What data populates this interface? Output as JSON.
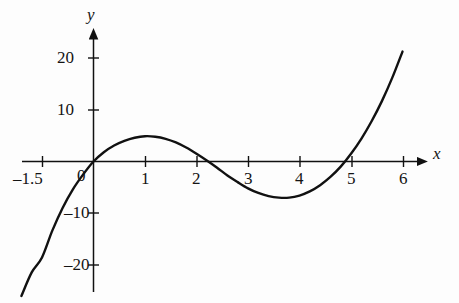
{
  "chart_data": {
    "type": "line",
    "title": "",
    "subtitle": "",
    "xlabel": "x",
    "ylabel": "y",
    "xlim": [
      -1.9,
      6.5
    ],
    "ylim": [
      -26,
      24
    ],
    "grid": false,
    "legend": null,
    "axis_style": "arrowed-axes-through-origin",
    "x_ticks": [
      -1.5,
      1,
      2,
      3,
      4,
      5,
      6
    ],
    "x_tick_labels": [
      "–1.5",
      "1",
      "2",
      "3",
      "4",
      "5",
      "6"
    ],
    "y_ticks": [
      20,
      10,
      -10,
      -20
    ],
    "y_tick_labels": [
      "20",
      "10",
      "–10",
      "–20"
    ],
    "origin_label": "0",
    "annotations": [],
    "series": [
      {
        "name": "cubic curve",
        "color": "#111111",
        "linewidth": 2.4,
        "roots": [
          0,
          2.1,
          5
        ],
        "local_max": {
          "x": 1.0,
          "y": 5.0
        },
        "local_min": {
          "x": 3.8,
          "y": -7.0
        },
        "x": [
          -1.75,
          -1.6,
          -1.4,
          -1.2,
          -1.0,
          -0.8,
          -0.6,
          -0.4,
          -0.2,
          0.0,
          0.2,
          0.4,
          0.6,
          0.8,
          1.0,
          1.2,
          1.4,
          1.6,
          1.8,
          2.0,
          2.2,
          2.4,
          2.6,
          2.8,
          3.0,
          3.2,
          3.4,
          3.6,
          3.8,
          4.0,
          4.2,
          4.4,
          4.6,
          4.8,
          5.0,
          5.2,
          5.4,
          5.6,
          5.8,
          6.0
        ],
        "y": [
          -45.4,
          -37.6,
          -29.0,
          -21.5,
          -18.6,
          -13.4,
          -9.0,
          -5.4,
          -2.5,
          0.0,
          1.8,
          3.1,
          4.0,
          4.6,
          4.9,
          4.8,
          4.4,
          3.7,
          2.7,
          1.5,
          0.2,
          -1.2,
          -2.7,
          -4.0,
          -5.2,
          -6.1,
          -6.7,
          -7.0,
          -7.0,
          -6.6,
          -5.8,
          -4.6,
          -3.0,
          -1.0,
          1.5,
          4.4,
          7.8,
          11.7,
          16.2,
          21.3
        ]
      }
    ]
  },
  "labels": {
    "y_axis_name": "y",
    "x_axis_name": "x",
    "origin": "0",
    "y20": "20",
    "y10": "10",
    "yneg10": "–10",
    "yneg20": "–20",
    "xneg15": "–1.5",
    "x1": "1",
    "x2": "2",
    "x3": "3",
    "x4": "4",
    "x5": "5",
    "x6": "6"
  }
}
